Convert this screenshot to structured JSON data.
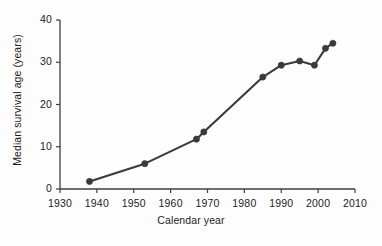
{
  "chart_data": {
    "type": "line",
    "title": "",
    "subtitle": "",
    "xlabel": "Calendar year",
    "ylabel": "Median survival age (years)",
    "xlim": [
      1930,
      2010
    ],
    "ylim": [
      0,
      40
    ],
    "xticks": [
      1930,
      1940,
      1950,
      1960,
      1970,
      1980,
      1990,
      2000,
      2010
    ],
    "yticks": [
      0,
      10,
      20,
      30,
      40
    ],
    "xtick_labels": [
      "1930",
      "1940",
      "1950",
      "1960",
      "1970",
      "1980",
      "1990",
      "2000",
      "2010"
    ],
    "ytick_labels": [
      "0",
      "10",
      "20",
      "30",
      "40"
    ],
    "grid": false,
    "legend": null,
    "legend_position": "none",
    "marker": "circle",
    "line_color": "#3a3a3a",
    "marker_color": "#3a3a3a",
    "series": [
      {
        "name": "Median survival age",
        "x": [
          1938,
          1953,
          1967,
          1969,
          1985,
          1990,
          1995,
          1999,
          2002,
          2004
        ],
        "values": [
          1.8,
          6.0,
          11.8,
          13.5,
          26.5,
          29.3,
          30.3,
          29.3,
          33.3,
          34.5
        ]
      }
    ],
    "annotations": []
  },
  "axis": {
    "ylabel": "Median survival age (years)",
    "xlabel": "Calendar year"
  }
}
